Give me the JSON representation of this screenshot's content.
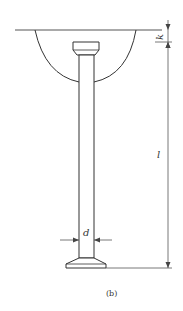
{
  "diagram": {
    "caption": "(b)",
    "labels": {
      "k": "k",
      "l": "l",
      "d": "d"
    },
    "colors": {
      "stroke": "#333333",
      "dim_stroke": "#555555",
      "background": "#ffffff"
    },
    "parts": [
      {
        "name": "surface-line",
        "description": "horizontal reference surface"
      },
      {
        "name": "hemisphere-arc",
        "description": "semicircular cavity below surface"
      },
      {
        "name": "stud-head",
        "description": "trapezoidal head at top"
      },
      {
        "name": "stud-shaft",
        "description": "long cylindrical shaft"
      },
      {
        "name": "stud-base",
        "description": "flared base at bottom"
      }
    ],
    "dimensions": [
      {
        "symbol": "k",
        "meaning": "head offset below surface"
      },
      {
        "symbol": "l",
        "meaning": "overall length"
      },
      {
        "symbol": "d",
        "meaning": "shaft diameter"
      }
    ]
  }
}
